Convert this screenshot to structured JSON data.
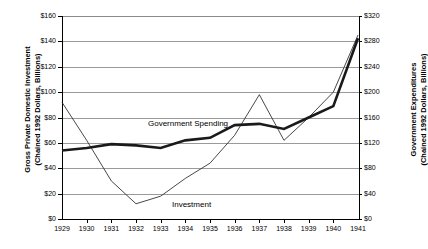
{
  "chart_data": {
    "type": "line",
    "title": "",
    "xlabel": "",
    "x": [
      1929,
      1930,
      1931,
      1932,
      1933,
      1934,
      1935,
      1936,
      1937,
      1938,
      1939,
      1940,
      1941
    ],
    "categories": [
      "1929",
      "1930",
      "1931",
      "1932",
      "1933",
      "1934",
      "1935",
      "1936",
      "1937",
      "1938",
      "1939",
      "1940",
      "1941"
    ],
    "grid": true,
    "legend_position": "inline-annotations",
    "axes": {
      "left": {
        "label_line1": "Gross Private Domestic Investment",
        "label_line2": "(Chained 1992 Dollars, Billions)",
        "ticks": [
          "$0",
          "$20",
          "$40",
          "$60",
          "$80",
          "$100",
          "$120",
          "$140",
          "$160"
        ],
        "tick_values": [
          0,
          20,
          40,
          60,
          80,
          100,
          120,
          140,
          160
        ],
        "ylim": [
          0,
          160
        ]
      },
      "right": {
        "label_line1": "Government Expenditures",
        "label_line2": "(Chained 1992 Dollars, Billions)",
        "ticks": [
          "$0",
          "$40",
          "$80",
          "$120",
          "$160",
          "$200",
          "$240",
          "$280",
          "$320"
        ],
        "tick_values": [
          0,
          40,
          80,
          120,
          160,
          200,
          240,
          280,
          320
        ],
        "ylim": [
          0,
          320
        ]
      }
    },
    "series": [
      {
        "name": "Investment",
        "annotation_label": "Investment",
        "axis": "left",
        "style": "thin",
        "color": "#333333",
        "values": [
          92,
          62,
          30,
          12,
          18,
          32,
          44,
          66,
          98,
          62,
          80,
          100,
          145
        ]
      },
      {
        "name": "Government Spending",
        "annotation_label": "Government Spending",
        "axis": "right",
        "style": "thick",
        "color": "#1a1a1a",
        "values": [
          108,
          112,
          118,
          116,
          112,
          124,
          128,
          148,
          150,
          142,
          160,
          178,
          285
        ]
      }
    ]
  }
}
